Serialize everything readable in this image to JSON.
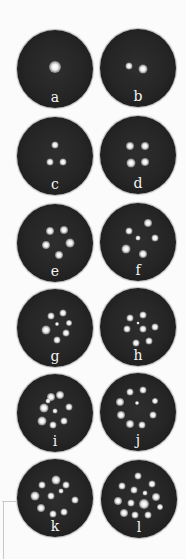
{
  "figure": {
    "panels": [
      {
        "label": "a",
        "x": 17,
        "y": 30,
        "dots": [
          [
            50,
            48,
            12
          ]
        ]
      },
      {
        "label": "b",
        "x": 100,
        "y": 29,
        "dots": [
          [
            38,
            47,
            7
          ],
          [
            56,
            51,
            9
          ]
        ]
      },
      {
        "label": "c",
        "x": 17,
        "y": 117,
        "dots": [
          [
            50,
            36,
            7
          ],
          [
            43,
            58,
            7
          ],
          [
            61,
            58,
            7
          ]
        ]
      },
      {
        "label": "d",
        "x": 100,
        "y": 116,
        "dots": [
          [
            40,
            38,
            8
          ],
          [
            59,
            38,
            8
          ],
          [
            41,
            60,
            9
          ],
          [
            59,
            59,
            8
          ]
        ]
      },
      {
        "label": "e",
        "x": 17,
        "y": 204,
        "dots": [
          [
            43,
            35,
            8
          ],
          [
            62,
            33,
            8
          ],
          [
            38,
            53,
            8
          ],
          [
            70,
            50,
            9
          ],
          [
            55,
            66,
            8
          ]
        ]
      },
      {
        "label": "f",
        "x": 100,
        "y": 203,
        "dots": [
          [
            38,
            36,
            7
          ],
          [
            63,
            26,
            8
          ],
          [
            50,
            45,
            5
          ],
          [
            72,
            45,
            7
          ],
          [
            34,
            59,
            9
          ],
          [
            57,
            66,
            8
          ]
        ]
      },
      {
        "label": "g",
        "x": 17,
        "y": 289,
        "dots": [
          [
            45,
            35,
            7
          ],
          [
            60,
            31,
            7
          ],
          [
            68,
            43,
            6
          ],
          [
            38,
            53,
            9
          ],
          [
            64,
            57,
            7
          ],
          [
            52,
            66,
            7
          ],
          [
            52,
            45,
            4
          ]
        ]
      },
      {
        "label": "h",
        "x": 100,
        "y": 288,
        "dots": [
          [
            40,
            38,
            7
          ],
          [
            57,
            35,
            7
          ],
          [
            35,
            53,
            7
          ],
          [
            56,
            52,
            7
          ],
          [
            73,
            50,
            7
          ],
          [
            47,
            70,
            7
          ],
          [
            65,
            68,
            7
          ],
          [
            50,
            45,
            3
          ]
        ]
      },
      {
        "label": "i",
        "x": 17,
        "y": 374,
        "dots": [
          [
            45,
            29,
            8
          ],
          [
            57,
            27,
            8
          ],
          [
            35,
            44,
            9
          ],
          [
            68,
            42,
            7
          ],
          [
            50,
            47,
            5
          ],
          [
            33,
            60,
            9
          ],
          [
            48,
            66,
            7
          ],
          [
            62,
            60,
            7
          ],
          [
            41,
            34,
            5
          ]
        ]
      },
      {
        "label": "j",
        "x": 100,
        "y": 373,
        "dots": [
          [
            40,
            24,
            7
          ],
          [
            57,
            22,
            7
          ],
          [
            26,
            37,
            8
          ],
          [
            72,
            36,
            6
          ],
          [
            49,
            39,
            4
          ],
          [
            27,
            54,
            8
          ],
          [
            70,
            54,
            7
          ],
          [
            39,
            66,
            8
          ],
          [
            55,
            67,
            7
          ]
        ]
      },
      {
        "label": "k",
        "x": 17,
        "y": 459,
        "dots": [
          [
            51,
            27,
            9
          ],
          [
            33,
            33,
            7
          ],
          [
            65,
            33,
            7
          ],
          [
            24,
            47,
            9
          ],
          [
            45,
            47,
            7
          ],
          [
            58,
            41,
            5
          ],
          [
            76,
            53,
            7
          ],
          [
            32,
            63,
            8
          ],
          [
            47,
            71,
            7
          ],
          [
            62,
            68,
            7
          ]
        ]
      },
      {
        "label": "l",
        "x": 101,
        "y": 460,
        "dots": [
          [
            49,
            21,
            7
          ],
          [
            28,
            33,
            7
          ],
          [
            67,
            31,
            7
          ],
          [
            44,
            39,
            7
          ],
          [
            58,
            42,
            5
          ],
          [
            22,
            52,
            8
          ],
          [
            40,
            55,
            7
          ],
          [
            57,
            57,
            10
          ],
          [
            73,
            48,
            8
          ],
          [
            30,
            68,
            8
          ],
          [
            45,
            71,
            7
          ],
          [
            62,
            71,
            7
          ],
          [
            77,
            60,
            6
          ]
        ]
      }
    ]
  }
}
